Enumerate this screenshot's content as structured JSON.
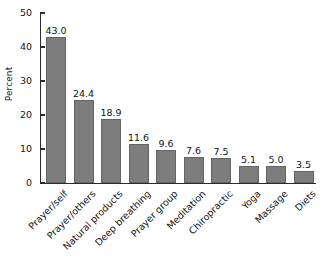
{
  "chart_data": {
    "type": "bar",
    "title": "",
    "xlabel": "",
    "ylabel": "Percent",
    "categories": [
      "Prayer/self",
      "Prayer/others",
      "Natural products",
      "Deep breathing",
      "Prayer group",
      "Meditation",
      "Chiropractic",
      "Yoga",
      "Massage",
      "Diets"
    ],
    "values": [
      43.0,
      24.4,
      18.9,
      11.6,
      9.6,
      7.6,
      7.5,
      5.1,
      5.0,
      3.5
    ],
    "value_labels": [
      "43.0",
      "24.4",
      "18.9",
      "11.6",
      "9.6",
      "7.6",
      "7.5",
      "5.1",
      "5.0",
      "3.5"
    ],
    "ylim": [
      0,
      50
    ],
    "yticks": [
      0,
      10,
      20,
      30,
      40,
      50
    ],
    "ytick_labels": [
      "0",
      "10",
      "20",
      "30",
      "40",
      "50"
    ],
    "grid": false,
    "legend": false,
    "bar_color": "#7d7d7d",
    "axis_color": "#2b2b2b",
    "background_color": "#ffffff"
  }
}
